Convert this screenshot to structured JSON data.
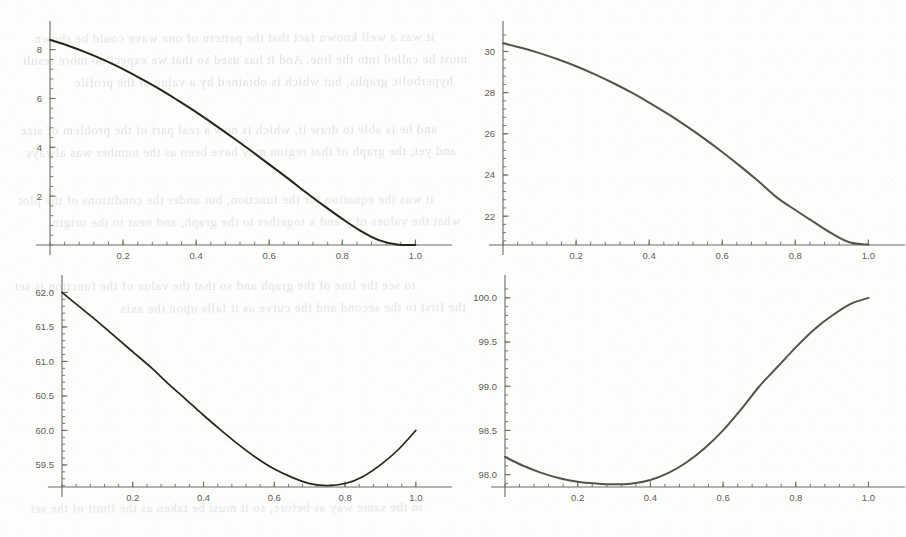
{
  "figure": {
    "background_color": "#fdfdfc",
    "panel_count": 4,
    "layout": "2x2 grid of line plots"
  },
  "ghost_text": {
    "note": "faint bleed-through text from reverse side of scanned page (illegible)",
    "color": "#b9b7b4",
    "lines": [
      {
        "text": "it was a well known fact that the pattern of one wave could be shown",
        "x": 34,
        "y": 30,
        "size": 13,
        "rotate": -0.3
      },
      {
        "text": "must be called into the line. And it has used so that we expect no more result",
        "x": 22,
        "y": 52,
        "size": 13,
        "rotate": -0.2
      },
      {
        "text": "hyperbolic graphs, but which is obtained by a value of the profile",
        "x": 74,
        "y": 74,
        "size": 13,
        "rotate": -0.25
      },
      {
        "text": "and he is able to draw it, which is now a real part of the problem of size",
        "x": 20,
        "y": 122,
        "size": 13,
        "rotate": -0.2
      },
      {
        "text": "and yet, the graph of that region may have been as the number was always",
        "x": 26,
        "y": 144,
        "size": 13,
        "rotate": -0.3
      },
      {
        "text": "it was the equation for the function, but under the conditions of the plot",
        "x": 18,
        "y": 192,
        "size": 13,
        "rotate": -0.2
      },
      {
        "text": "what the values of y and x together to the graph, and near to the origin",
        "x": 52,
        "y": 214,
        "size": 13,
        "rotate": -0.25
      },
      {
        "text": "to see the line of the graph and so that the value of the function is set",
        "x": 14,
        "y": 278,
        "size": 13,
        "rotate": -0.2
      },
      {
        "text": "the first to the second and the curve as it falls upon the axis",
        "x": 120,
        "y": 300,
        "size": 13,
        "rotate": -0.3
      },
      {
        "text": "in the same way as before, so it must be taken as the limit of the set",
        "x": 30,
        "y": 500,
        "size": 13,
        "rotate": -0.2
      }
    ]
  },
  "chart_data": [
    {
      "id": "plot-top-left",
      "position": "top-left",
      "type": "line",
      "title": "",
      "xlabel": "",
      "ylabel": "",
      "xlim": [
        0,
        1.04
      ],
      "ylim": [
        0,
        8.6
      ],
      "x_ticks": [
        0.2,
        0.4,
        0.6,
        0.8,
        1.0
      ],
      "x_tick_labels": [
        "0.2",
        "0.4",
        "0.6",
        "0.8",
        "1.0"
      ],
      "y_ticks": [
        2,
        4,
        6,
        8
      ],
      "y_tick_labels": [
        "2",
        "4",
        "6",
        "8"
      ],
      "grid": false,
      "legend": "none",
      "line_color": "#262421",
      "line_width": 2.0,
      "x": [
        0.0,
        0.05,
        0.1,
        0.15,
        0.2,
        0.25,
        0.3,
        0.35,
        0.4,
        0.45,
        0.5,
        0.55,
        0.6,
        0.65,
        0.7,
        0.75,
        0.8,
        0.85,
        0.9,
        0.95,
        1.0
      ],
      "y": [
        8.4,
        8.16,
        7.88,
        7.56,
        7.2,
        6.8,
        6.38,
        5.92,
        5.44,
        4.93,
        4.4,
        3.86,
        3.3,
        2.74,
        2.16,
        1.6,
        1.07,
        0.58,
        0.2,
        0.02,
        0.0
      ]
    },
    {
      "id": "plot-top-right",
      "position": "top-right",
      "type": "line",
      "title": "",
      "xlabel": "",
      "ylabel": "",
      "xlim": [
        0,
        1.04
      ],
      "ylim": [
        20.6,
        30.8
      ],
      "x_ticks": [
        0.2,
        0.4,
        0.6,
        0.8,
        1.0
      ],
      "x_tick_labels": [
        "0.2",
        "0.4",
        "0.6",
        "0.8",
        "1.0"
      ],
      "y_ticks": [
        22,
        24,
        26,
        28,
        30
      ],
      "y_tick_labels": [
        "22",
        "24",
        "26",
        "28",
        "30"
      ],
      "grid": false,
      "legend": "none",
      "line_color": "#55524f",
      "line_width": 2.0,
      "x": [
        0.0,
        0.05,
        0.1,
        0.15,
        0.2,
        0.25,
        0.3,
        0.35,
        0.4,
        0.45,
        0.5,
        0.55,
        0.6,
        0.65,
        0.7,
        0.75,
        0.8,
        0.85,
        0.9,
        0.95,
        1.0
      ],
      "y": [
        30.4,
        30.18,
        29.92,
        29.62,
        29.28,
        28.9,
        28.48,
        28.02,
        27.52,
        26.98,
        26.4,
        25.78,
        25.12,
        24.42,
        23.68,
        22.9,
        22.3,
        21.72,
        21.16,
        20.72,
        20.62
      ]
    },
    {
      "id": "plot-bottom-left",
      "position": "bottom-left",
      "type": "line",
      "title": "",
      "xlabel": "",
      "ylabel": "",
      "xlim": [
        0,
        1.04
      ],
      "ylim": [
        59.18,
        62.05
      ],
      "x_ticks": [
        0.2,
        0.4,
        0.6,
        0.8,
        1.0
      ],
      "x_tick_labels": [
        "0.2",
        "0.4",
        "0.6",
        "0.8",
        "1.0"
      ],
      "y_ticks": [
        59.5,
        60.0,
        60.5,
        61.0,
        61.5,
        62.0
      ],
      "y_tick_labels": [
        "59.5",
        "60.0",
        "60.5",
        "61.0",
        "61.5",
        "62.0"
      ],
      "grid": false,
      "legend": "none",
      "line_color": "#262421",
      "line_width": 1.7,
      "minimum": {
        "x": 0.75,
        "y": 59.2
      },
      "x": [
        0.0,
        0.05,
        0.1,
        0.15,
        0.2,
        0.25,
        0.3,
        0.35,
        0.4,
        0.45,
        0.5,
        0.55,
        0.6,
        0.65,
        0.7,
        0.75,
        0.8,
        0.85,
        0.9,
        0.95,
        1.0
      ],
      "y": [
        62.0,
        61.79,
        61.58,
        61.36,
        61.14,
        60.92,
        60.68,
        60.45,
        60.22,
        60.0,
        59.79,
        59.6,
        59.44,
        59.32,
        59.23,
        59.2,
        59.23,
        59.33,
        59.5,
        59.72,
        60.0
      ]
    },
    {
      "id": "plot-bottom-right",
      "position": "bottom-right",
      "type": "line",
      "title": "",
      "xlabel": "",
      "ylabel": "",
      "xlim": [
        0,
        1.04
      ],
      "ylim": [
        97.86,
        100.1
      ],
      "x_ticks": [
        0.2,
        0.4,
        0.6,
        0.8,
        1.0
      ],
      "x_tick_labels": [
        "0.2",
        "0.4",
        "0.6",
        "0.8",
        "1.0"
      ],
      "y_ticks": [
        98.0,
        98.5,
        99.0,
        99.5,
        100.0
      ],
      "y_tick_labels": [
        "98.0",
        "98.5",
        "99.0",
        "99.5",
        "100.0"
      ],
      "grid": false,
      "legend": "none",
      "line_color": "#55524f",
      "line_width": 2.0,
      "minimum": {
        "x": 0.32,
        "y": 97.9
      },
      "x": [
        0.0,
        0.05,
        0.1,
        0.15,
        0.2,
        0.25,
        0.3,
        0.35,
        0.4,
        0.45,
        0.5,
        0.55,
        0.6,
        0.65,
        0.7,
        0.75,
        0.8,
        0.85,
        0.9,
        0.95,
        1.0
      ],
      "y": [
        98.2,
        98.1,
        98.02,
        97.96,
        97.92,
        97.9,
        97.89,
        97.9,
        97.94,
        98.02,
        98.14,
        98.3,
        98.5,
        98.74,
        99.0,
        99.22,
        99.44,
        99.64,
        99.8,
        99.93,
        100.0
      ]
    }
  ]
}
